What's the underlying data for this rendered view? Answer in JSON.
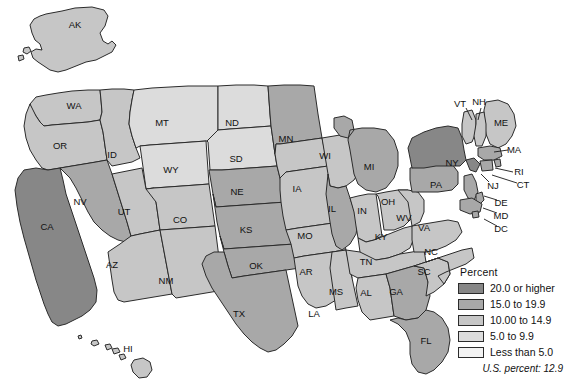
{
  "figure": {
    "type": "choropleth-map",
    "region": "United States",
    "background": "#ffffff"
  },
  "legend": {
    "title": "Percent",
    "classes": [
      {
        "label": "20.0 or higher",
        "color": "#878787",
        "min": 20.0,
        "max": null
      },
      {
        "label": "15.0 to 19.9",
        "color": "#a8a8a8",
        "min": 15.0,
        "max": 19.9
      },
      {
        "label": "10.00 to 14.9",
        "color": "#c6c6c6",
        "min": 10.0,
        "max": 14.9
      },
      {
        "label": "5.0 to 9.9",
        "color": "#dcdcdc",
        "min": 5.0,
        "max": 9.9
      },
      {
        "label": "Less than 5.0",
        "color": "#f2f2f2",
        "min": null,
        "max": 5.0
      }
    ],
    "footnote": "U.S. percent: 12.9",
    "us_percent": 12.9
  },
  "chart_data": {
    "type": "heatmap",
    "title": "",
    "value_label": "Percent",
    "class_breaks": [
      5.0,
      10.0,
      15.0,
      20.0
    ],
    "class_labels": [
      "Less than 5.0",
      "5.0 to 9.9",
      "10.00 to 14.9",
      "15.0 to 19.9",
      "20.0 or higher"
    ],
    "class_colors": [
      "#f2f2f2",
      "#dcdcdc",
      "#c6c6c6",
      "#a8a8a8",
      "#878787"
    ],
    "us_percent": 12.9,
    "states": [
      {
        "code": "AK",
        "class": 2,
        "label_x": 75,
        "label_y": 25
      },
      {
        "code": "HI",
        "class": 2,
        "label_x": 128,
        "label_y": 349
      },
      {
        "code": "WA",
        "class": 2,
        "label_x": 74,
        "label_y": 106
      },
      {
        "code": "OR",
        "class": 2,
        "label_x": 60,
        "label_y": 146
      },
      {
        "code": "CA",
        "class": 4,
        "label_x": 47,
        "label_y": 227
      },
      {
        "code": "NV",
        "class": 3,
        "label_x": 80,
        "label_y": 202
      },
      {
        "code": "ID",
        "class": 2,
        "label_x": 112,
        "label_y": 155
      },
      {
        "code": "MT",
        "class": 1,
        "label_x": 162,
        "label_y": 123
      },
      {
        "code": "WY",
        "class": 1,
        "label_x": 171,
        "label_y": 170
      },
      {
        "code": "UT",
        "class": 2,
        "label_x": 124,
        "label_y": 212
      },
      {
        "code": "AZ",
        "class": 2,
        "label_x": 112,
        "label_y": 265
      },
      {
        "code": "CO",
        "class": 2,
        "label_x": 180,
        "label_y": 220
      },
      {
        "code": "NM",
        "class": 2,
        "label_x": 166,
        "label_y": 281
      },
      {
        "code": "ND",
        "class": 1,
        "label_x": 232,
        "label_y": 123
      },
      {
        "code": "SD",
        "class": 1,
        "label_x": 236,
        "label_y": 159
      },
      {
        "code": "NE",
        "class": 3,
        "label_x": 237,
        "label_y": 192
      },
      {
        "code": "KS",
        "class": 3,
        "label_x": 246,
        "label_y": 230
      },
      {
        "code": "OK",
        "class": 3,
        "label_x": 256,
        "label_y": 266
      },
      {
        "code": "TX",
        "class": 3,
        "label_x": 239,
        "label_y": 314
      },
      {
        "code": "MN",
        "class": 3,
        "label_x": 286,
        "label_y": 139
      },
      {
        "code": "IA",
        "class": 2,
        "label_x": 297,
        "label_y": 189
      },
      {
        "code": "MO",
        "class": 2,
        "label_x": 305,
        "label_y": 236
      },
      {
        "code": "AR",
        "class": 2,
        "label_x": 306,
        "label_y": 272
      },
      {
        "code": "LA",
        "class": 2,
        "label_x": 314,
        "label_y": 314
      },
      {
        "code": "WI",
        "class": 2,
        "label_x": 325,
        "label_y": 156
      },
      {
        "code": "IL",
        "class": 3,
        "label_x": 332,
        "label_y": 209
      },
      {
        "code": "MS",
        "class": 2,
        "label_x": 336,
        "label_y": 292
      },
      {
        "code": "MI",
        "class": 3,
        "label_x": 369,
        "label_y": 167
      },
      {
        "code": "IN",
        "class": 2,
        "label_x": 362,
        "label_y": 211
      },
      {
        "code": "OH",
        "class": 2,
        "label_x": 388,
        "label_y": 202
      },
      {
        "code": "KY",
        "class": 2,
        "label_x": 381,
        "label_y": 237
      },
      {
        "code": "TN",
        "class": 2,
        "label_x": 366,
        "label_y": 262
      },
      {
        "code": "AL",
        "class": 2,
        "label_x": 366,
        "label_y": 293
      },
      {
        "code": "GA",
        "class": 3,
        "label_x": 396,
        "label_y": 292
      },
      {
        "code": "FL",
        "class": 3,
        "label_x": 426,
        "label_y": 341
      },
      {
        "code": "SC",
        "class": 2,
        "label_x": 424,
        "label_y": 272
      },
      {
        "code": "NC",
        "class": 2,
        "label_x": 431,
        "label_y": 252
      },
      {
        "code": "VA",
        "class": 2,
        "label_x": 424,
        "label_y": 228
      },
      {
        "code": "WV",
        "class": 2,
        "label_x": 404,
        "label_y": 218
      },
      {
        "code": "PA",
        "class": 3,
        "label_x": 436,
        "label_y": 185
      },
      {
        "code": "NY",
        "class": 4,
        "label_x": 452,
        "label_y": 163
      },
      {
        "code": "ME",
        "class": 2,
        "label_x": 501,
        "label_y": 123
      },
      {
        "code": "VT",
        "class": 2,
        "label_x": 460,
        "label_y": 104
      },
      {
        "code": "NH",
        "class": 2,
        "label_x": 479,
        "label_y": 102
      },
      {
        "code": "MA",
        "class": 3,
        "label_x": 514,
        "label_y": 150
      },
      {
        "code": "RI",
        "class": 3,
        "label_x": 519,
        "label_y": 172
      },
      {
        "code": "CT",
        "class": 3,
        "label_x": 523,
        "label_y": 185
      },
      {
        "code": "NJ",
        "class": 3,
        "label_x": 493,
        "label_y": 186
      },
      {
        "code": "DE",
        "class": 3,
        "label_x": 501,
        "label_y": 203
      },
      {
        "code": "MD",
        "class": 3,
        "label_x": 501,
        "label_y": 216
      },
      {
        "code": "DC",
        "class": 3,
        "label_x": 501,
        "label_y": 229
      }
    ]
  },
  "state_names": {
    "AK": "Alaska",
    "HI": "Hawaii",
    "WA": "Washington",
    "OR": "Oregon",
    "CA": "California",
    "NV": "Nevada",
    "ID": "Idaho",
    "MT": "Montana",
    "WY": "Wyoming",
    "UT": "Utah",
    "AZ": "Arizona",
    "CO": "Colorado",
    "NM": "New Mexico",
    "ND": "North Dakota",
    "SD": "South Dakota",
    "NE": "Nebraska",
    "KS": "Kansas",
    "OK": "Oklahoma",
    "TX": "Texas",
    "MN": "Minnesota",
    "IA": "Iowa",
    "MO": "Missouri",
    "AR": "Arkansas",
    "LA": "Louisiana",
    "WI": "Wisconsin",
    "IL": "Illinois",
    "MS": "Mississippi",
    "MI": "Michigan",
    "IN": "Indiana",
    "OH": "Ohio",
    "KY": "Kentucky",
    "TN": "Tennessee",
    "AL": "Alabama",
    "GA": "Georgia",
    "FL": "Florida",
    "SC": "South Carolina",
    "NC": "North Carolina",
    "VA": "Virginia",
    "WV": "West Virginia",
    "PA": "Pennsylvania",
    "NY": "New York",
    "ME": "Maine",
    "VT": "Vermont",
    "NH": "New Hampshire",
    "MA": "Massachusetts",
    "RI": "Rhode Island",
    "CT": "Connecticut",
    "NJ": "New Jersey",
    "DE": "Delaware",
    "MD": "Maryland",
    "DC": "District of Columbia"
  }
}
